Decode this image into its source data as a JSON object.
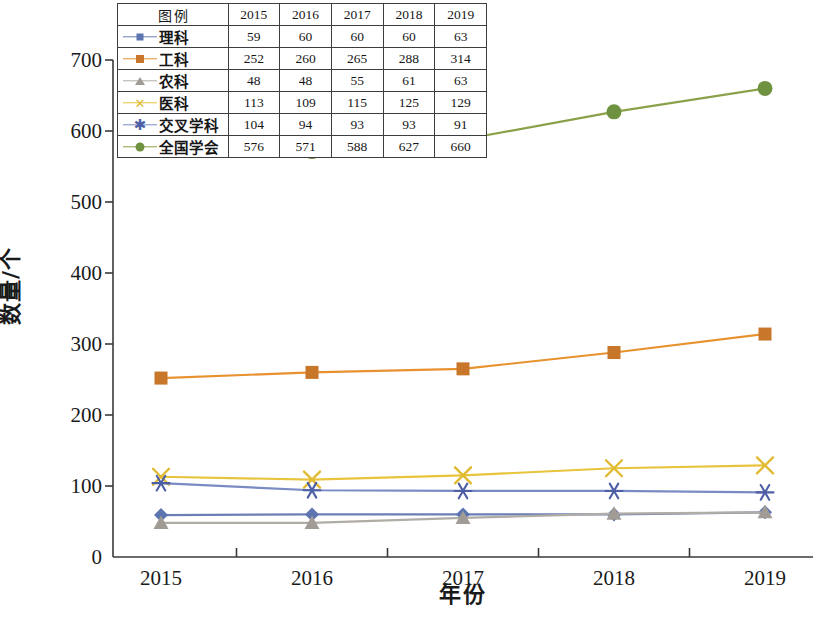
{
  "chart_data": {
    "type": "line",
    "title": "",
    "xlabel": "年份",
    "ylabel": "数量/个",
    "categories": [
      "2015",
      "2016",
      "2017",
      "2018",
      "2019"
    ],
    "x": [
      2015,
      2016,
      2017,
      2018,
      2019
    ],
    "ylim": [
      0,
      700
    ],
    "yticks": [
      0,
      100,
      200,
      300,
      400,
      500,
      600,
      700
    ],
    "ytick_labels": [
      "0",
      "100",
      "200",
      "300",
      "400",
      "500",
      "600",
      "700"
    ],
    "grid": false,
    "legend_position": "top-overlay-table",
    "legend_header": "图例",
    "series": [
      {
        "name": "理科",
        "values": [
          59,
          60,
          60,
          60,
          63
        ],
        "color": "#6b7fb5",
        "marker": "diamond",
        "marker_color": "#5c74b0"
      },
      {
        "name": "工科",
        "values": [
          252,
          260,
          265,
          288,
          314
        ],
        "color": "#e8912f",
        "marker": "square",
        "marker_color": "#c8762a"
      },
      {
        "name": "农科",
        "values": [
          48,
          48,
          55,
          61,
          63
        ],
        "color": "#b0aca6",
        "marker": "triangle",
        "marker_color": "#a09b94"
      },
      {
        "name": "医科",
        "values": [
          113,
          109,
          115,
          125,
          129
        ],
        "color": "#e8c33c",
        "marker": "x",
        "marker_color": "#e0bb33"
      },
      {
        "name": "交叉学科",
        "values": [
          104,
          94,
          93,
          93,
          91
        ],
        "color": "#7a8bc4",
        "marker": "asterisk",
        "marker_color": "#4d5fa5"
      },
      {
        "name": "全国学会",
        "values": [
          576,
          571,
          588,
          627,
          660
        ],
        "color": "#8aa14a",
        "marker": "circle",
        "marker_color": "#6f9240"
      }
    ],
    "legend_table": {
      "header": [
        "图例",
        "2015",
        "2016",
        "2017",
        "2018",
        "2019"
      ],
      "rows": [
        {
          "name": "理科",
          "cells": [
            "59",
            "60",
            "60",
            "60",
            "63"
          ]
        },
        {
          "name": "工科",
          "cells": [
            "252",
            "260",
            "265",
            "288",
            "314"
          ]
        },
        {
          "name": "农科",
          "cells": [
            "48",
            "48",
            "55",
            "61",
            "63"
          ]
        },
        {
          "name": "医科",
          "cells": [
            "113",
            "109",
            "115",
            "125",
            "129"
          ]
        },
        {
          "name": "交叉学科",
          "cells": [
            "104",
            "94",
            "93",
            "93",
            "91"
          ]
        },
        {
          "name": "全国学会",
          "cells": [
            "576",
            "571",
            "588",
            "627",
            "660"
          ]
        }
      ]
    }
  }
}
